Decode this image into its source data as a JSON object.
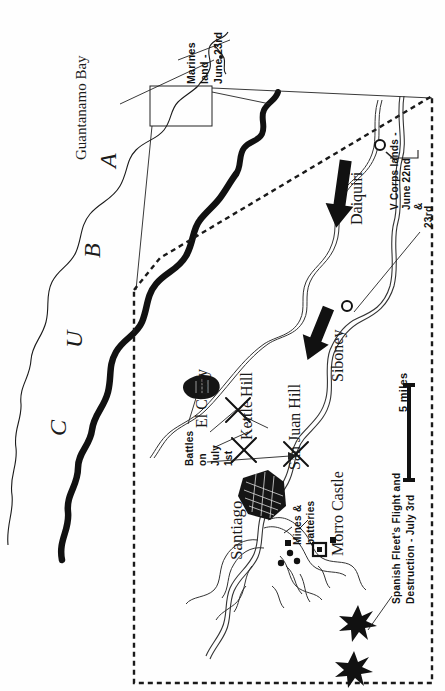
{
  "map": {
    "title": "Santiago de Cuba Campaign, 1898",
    "orientation_note": "All labels rotated 90 degrees (read bottom-to-top)",
    "background_color": "#ffffff",
    "ink_color": "#111111"
  },
  "overview": {
    "country_label_letters": [
      "C",
      "U",
      "B",
      "A"
    ],
    "country_label": "CUBA",
    "bay_label": "Guantanamo Bay",
    "marines_note": "Marines land - June 23rd",
    "marines_note_lines": [
      "Marines",
      "land -",
      "June 23rd"
    ]
  },
  "inset": {
    "border_style": "dashed",
    "places": [
      {
        "name": "Daiquiri",
        "kind": "landing-town"
      },
      {
        "name": "Siboney",
        "kind": "landing-town"
      },
      {
        "name": "Santiago",
        "kind": "city"
      },
      {
        "name": "El Caney",
        "kind": "battle-village"
      },
      {
        "name": "Kettle Hill",
        "kind": "battle-hill"
      },
      {
        "name": "San Juan Hill",
        "kind": "battle-hill"
      },
      {
        "name": "Morro Castle",
        "kind": "fort"
      }
    ],
    "annotations": [
      {
        "id": "v-corps",
        "text": "V Corps lands - June 22nd & 23rd",
        "lines": [
          "V Corps lands -",
          "June 22nd",
          "&",
          "23rd"
        ]
      },
      {
        "id": "battles",
        "text": "Battles on July 1st",
        "lines": [
          "Battles",
          "on",
          "July",
          "1st"
        ]
      },
      {
        "id": "mines",
        "text": "Mines & batteries",
        "lines": [
          "Mines &",
          "batteries"
        ]
      },
      {
        "id": "fleet",
        "text": "Spanish Fleet's Flight and Destruction - July 3rd",
        "lines": [
          "Spanish Fleet's Flight and",
          "Destruction - July 3rd"
        ]
      }
    ],
    "scale": {
      "label": "5 miles",
      "value": 5,
      "unit": "miles"
    }
  },
  "symbols": {
    "battle": "crossed-swords-icon",
    "town": "circle-marker-icon",
    "fort": "square-fort-icon",
    "wreck": "starburst-wreck-icon",
    "movement": "black-arrow-icon"
  }
}
